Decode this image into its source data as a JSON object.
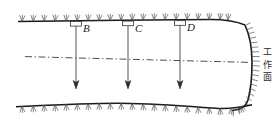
{
  "figure": {
    "type": "engineering-cross-section",
    "colors": {
      "line": "#1a1a1a",
      "hatch": "#555555",
      "dashdot": "#3a3a3a",
      "borehole": "#444444",
      "text": "#1a1a1a"
    }
  },
  "boreholes": [
    {
      "label": "B",
      "x": 76,
      "label_x": 83,
      "top_y": 22,
      "tip_y": 88
    },
    {
      "label": "C",
      "x": 128,
      "label_x": 135,
      "top_y": 22,
      "tip_y": 88
    },
    {
      "label": "D",
      "x": 180,
      "label_x": 187,
      "top_y": 22,
      "tip_y": 88
    }
  ],
  "annotations": {
    "working_face": {
      "text": "工作面",
      "chars": [
        "工",
        "作",
        "面"
      ],
      "orientation": "vertical",
      "x": 262,
      "y": 47
    }
  },
  "centerline": {
    "style": "dash-dot",
    "y_left": 57,
    "y_right": 63
  }
}
